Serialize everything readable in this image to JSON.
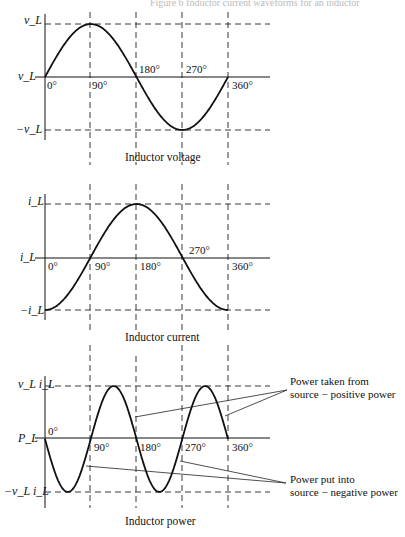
{
  "figure_title": "Figure 6 Inductor current waveforms for an inductor",
  "x_ticks": [
    "0°",
    "90°",
    "180°",
    "270°",
    "360°"
  ],
  "panels": [
    {
      "caption": "Inductor voltage",
      "y_labels": {
        "top": "v_L",
        "zero": "v_L",
        "bottom": "−v_L"
      },
      "waveform": "sin(θ)"
    },
    {
      "caption": "Inductor current",
      "y_labels": {
        "top": "i_L",
        "zero": "i_L",
        "bottom": "−i_L"
      },
      "waveform": "−cos(θ)"
    },
    {
      "caption": "Inductor power",
      "y_labels": {
        "top": "v_L i_L",
        "zero": "P_L",
        "bottom": "−v_L i_L"
      },
      "waveform": "−sin(2θ)"
    }
  ],
  "annotations": {
    "positive": [
      "Power taken from",
      "source − positive power"
    ],
    "negative": [
      "Power put into",
      "source − negative power"
    ]
  },
  "chart_data": [
    {
      "type": "line",
      "title": "Inductor voltage",
      "x": [
        0,
        90,
        180,
        270,
        360
      ],
      "values": [
        0,
        1,
        0,
        -1,
        0
      ],
      "xlabel": "angle (deg)",
      "ylabel": "v_L"
    },
    {
      "type": "line",
      "title": "Inductor current",
      "x": [
        0,
        90,
        180,
        270,
        360
      ],
      "values": [
        -1,
        0,
        1,
        0,
        -1
      ],
      "xlabel": "angle (deg)",
      "ylabel": "i_L"
    },
    {
      "type": "line",
      "title": "Inductor power",
      "x": [
        0,
        45,
        90,
        135,
        180,
        225,
        270,
        315,
        360
      ],
      "values": [
        0,
        -1,
        0,
        1,
        0,
        -1,
        0,
        1,
        0
      ],
      "xlabel": "angle (deg)",
      "ylabel": "P_L"
    }
  ]
}
